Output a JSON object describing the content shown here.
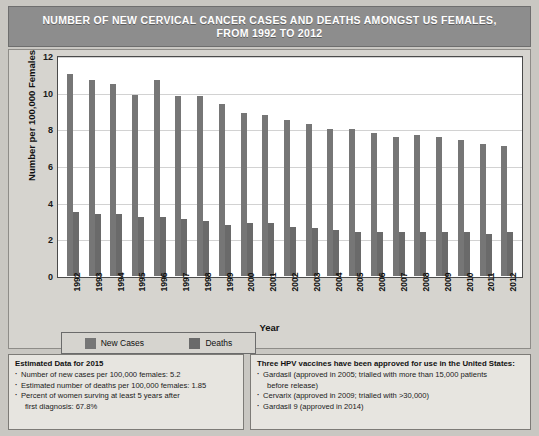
{
  "title": {
    "line1": "NUMBER OF NEW CERVICAL CANCER CASES AND DEATHS AMONGST US FEMALES,",
    "line2": "FROM 1992 TO 2012",
    "full": "NUMBER OF NEW CERVICAL CANCER CASES AND DEATHS AMONGST US FEMALES, FROM 1992 TO 2012"
  },
  "colors": {
    "new_cases": "#767676",
    "deaths": "#6a6a6a",
    "title_bar": "#8d8d8d",
    "poster_bg": "#c9c7c2",
    "panel_bg": "#d6d4cf",
    "note_bg": "#e7e5e0",
    "gridline": "#d2d2d2"
  },
  "legend": {
    "new_cases": "New Cases",
    "deaths": "Deaths"
  },
  "chart_data": {
    "type": "bar",
    "title": "NUMBER OF NEW CERVICAL CANCER CASES AND DEATHS AMONGST US FEMALES, FROM 1992 TO 2012",
    "xlabel": "Year",
    "ylabel": "Number per 100,000 Females",
    "ylim": [
      0,
      12
    ],
    "yticks": [
      0,
      2,
      4,
      6,
      8,
      10,
      12
    ],
    "grid": true,
    "legend_position": "below-plot-left",
    "categories": [
      "1992",
      "1993",
      "1994",
      "1995",
      "1996",
      "1997",
      "1998",
      "1999",
      "2000",
      "2001",
      "2002",
      "2003",
      "2004",
      "2005",
      "2006",
      "2007",
      "2008",
      "2009",
      "2010",
      "2011",
      "2012"
    ],
    "series": [
      {
        "name": "New Cases",
        "color": "#767676",
        "values": [
          11.0,
          10.7,
          10.5,
          9.9,
          10.7,
          9.8,
          9.8,
          9.4,
          8.9,
          8.8,
          8.5,
          8.3,
          8.0,
          8.0,
          7.8,
          7.6,
          7.7,
          7.6,
          7.4,
          7.2,
          7.1
        ]
      },
      {
        "name": "Deaths",
        "color": "#6a6a6a",
        "values": [
          3.5,
          3.4,
          3.4,
          3.2,
          3.2,
          3.1,
          3.0,
          2.8,
          2.9,
          2.9,
          2.7,
          2.6,
          2.5,
          2.4,
          2.4,
          2.4,
          2.4,
          2.4,
          2.4,
          2.3,
          2.4
        ]
      }
    ]
  },
  "notes": {
    "left": {
      "heading": "Estimated Data for 2015",
      "items": [
        "Number of new cases per 100,000 females: 5.2",
        "Estimated number of deaths per 100,000 females: 1.85",
        "Percent of women surving at least 5 years after"
      ],
      "continuation": "first diagnosis: 67.8%"
    },
    "right": {
      "heading": "Three HPV vaccines have been approved for use in the United States:",
      "items": [
        "Gardasil (approved in 2005; trialled with more than 15,000 patients",
        "Cervarix (approved in 2009; trialled with >30,000)",
        "Gardasil 9 (approved in 2014)"
      ],
      "continuation": "before release)"
    }
  }
}
